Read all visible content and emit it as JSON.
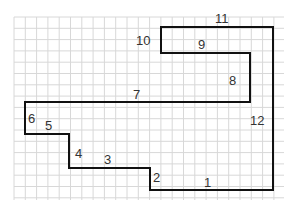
{
  "diagram": {
    "type": "rectilinear-polygon-on-grid",
    "grid": {
      "color": "#d8d8d8",
      "spacing": 11.3,
      "x0": 14,
      "y0": 17,
      "x1": 284,
      "y1": 200
    },
    "outline": {
      "color": "#111111",
      "points": [
        [
          161,
          27
        ],
        [
          273,
          27
        ],
        [
          273,
          190
        ],
        [
          150,
          190
        ],
        [
          150,
          168
        ],
        [
          69,
          168
        ],
        [
          69,
          134
        ],
        [
          25,
          134
        ],
        [
          25,
          102
        ],
        [
          250,
          102
        ],
        [
          250,
          53
        ],
        [
          161,
          53
        ]
      ]
    },
    "side_labels": [
      {
        "id": "1",
        "text": "1",
        "x": 204,
        "y": 176
      },
      {
        "id": "2",
        "text": "2",
        "x": 153,
        "y": 171
      },
      {
        "id": "3",
        "text": "3",
        "x": 104,
        "y": 153
      },
      {
        "id": "4",
        "text": "4",
        "x": 75,
        "y": 147
      },
      {
        "id": "5",
        "text": "5",
        "x": 45,
        "y": 119
      },
      {
        "id": "6",
        "text": "6",
        "x": 28,
        "y": 112
      },
      {
        "id": "7",
        "text": "7",
        "x": 133,
        "y": 88
      },
      {
        "id": "8",
        "text": "8",
        "x": 229,
        "y": 74
      },
      {
        "id": "9",
        "text": "9",
        "x": 198,
        "y": 38
      },
      {
        "id": "10",
        "text": "10",
        "x": 136,
        "y": 34
      },
      {
        "id": "11",
        "text": "11",
        "x": 215,
        "y": 12
      },
      {
        "id": "12",
        "text": "12",
        "x": 250,
        "y": 114
      }
    ]
  }
}
